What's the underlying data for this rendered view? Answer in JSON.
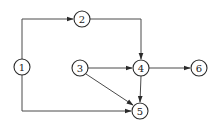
{
  "diagram": {
    "type": "directed-graph",
    "node_radius": 8,
    "colors": {
      "stroke": "#2a2a2a",
      "edge": "#4a4a4a",
      "background": "#ffffff",
      "text": "#222222"
    },
    "nodes": [
      {
        "id": "1",
        "label": "1",
        "x": 22,
        "y": 67
      },
      {
        "id": "2",
        "label": "2",
        "x": 82,
        "y": 19
      },
      {
        "id": "3",
        "label": "3",
        "x": 80,
        "y": 68
      },
      {
        "id": "4",
        "label": "4",
        "x": 141,
        "y": 68
      },
      {
        "id": "5",
        "label": "5",
        "x": 140,
        "y": 111
      },
      {
        "id": "6",
        "label": "6",
        "x": 199,
        "y": 68
      }
    ],
    "edges": [
      {
        "from": "1",
        "to": "2",
        "route": "up-then-right"
      },
      {
        "from": "1",
        "to": "5",
        "route": "down-then-right"
      },
      {
        "from": "2",
        "to": "4",
        "route": "right-then-down"
      },
      {
        "from": "3",
        "to": "4",
        "route": "straight"
      },
      {
        "from": "3",
        "to": "5",
        "route": "diagonal"
      },
      {
        "from": "4",
        "to": "5",
        "route": "straight"
      },
      {
        "from": "4",
        "to": "6",
        "route": "straight"
      }
    ]
  }
}
